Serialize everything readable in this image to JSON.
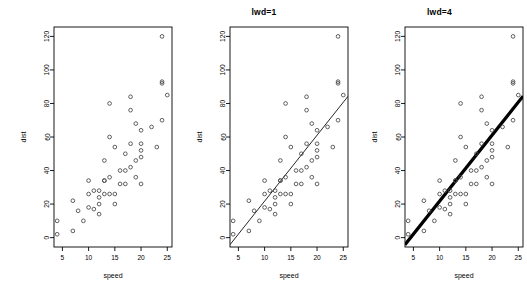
{
  "figure": {
    "background": "#ffffff",
    "foreground": "#000000",
    "point_symbol": "open-circle",
    "point_stroke": "#444444"
  },
  "panels": [
    {
      "name": "panel-plain",
      "title": "",
      "has_fit_line": false,
      "line_width": 0
    },
    {
      "name": "panel-lwd1",
      "title": "lwd=1",
      "has_fit_line": true,
      "line_width": 1
    },
    {
      "name": "panel-lwd4",
      "title": "lwd=4",
      "has_fit_line": true,
      "line_width": 4
    }
  ],
  "chart_data": {
    "type": "scatter",
    "title": "",
    "xlabel": "speed",
    "ylabel": "dist",
    "xlim": [
      3.4,
      25.9
    ],
    "ylim": [
      -5.6,
      125.6
    ],
    "xticks": [
      5,
      10,
      15,
      20,
      25
    ],
    "yticks": [
      0,
      20,
      40,
      60,
      80,
      100,
      120
    ],
    "xtick_labels": [
      "5",
      "10",
      "15",
      "20",
      "25"
    ],
    "ytick_labels": [
      "0",
      "20",
      "40",
      "60",
      "80",
      "100",
      "120"
    ],
    "grid": false,
    "legend": null,
    "x": [
      4,
      4,
      7,
      7,
      8,
      9,
      10,
      10,
      10,
      11,
      11,
      12,
      12,
      12,
      12,
      13,
      13,
      13,
      13,
      14,
      14,
      14,
      14,
      15,
      15,
      15,
      16,
      16,
      17,
      17,
      17,
      18,
      18,
      18,
      18,
      19,
      19,
      19,
      20,
      20,
      20,
      20,
      20,
      22,
      23,
      24,
      24,
      24,
      24,
      25
    ],
    "y": [
      2,
      10,
      4,
      22,
      16,
      10,
      18,
      26,
      34,
      17,
      28,
      14,
      20,
      24,
      28,
      26,
      34,
      34,
      46,
      26,
      36,
      60,
      80,
      20,
      26,
      54,
      32,
      40,
      32,
      40,
      50,
      42,
      56,
      76,
      84,
      36,
      46,
      68,
      32,
      48,
      52,
      56,
      64,
      66,
      54,
      70,
      92,
      93,
      120,
      85
    ],
    "series": [
      {
        "name": "cars",
        "x": [
          4,
          4,
          7,
          7,
          8,
          9,
          10,
          10,
          10,
          11,
          11,
          12,
          12,
          12,
          12,
          13,
          13,
          13,
          13,
          14,
          14,
          14,
          14,
          15,
          15,
          15,
          16,
          16,
          17,
          17,
          17,
          18,
          18,
          18,
          18,
          19,
          19,
          19,
          20,
          20,
          20,
          20,
          20,
          22,
          23,
          24,
          24,
          24,
          24,
          25
        ],
        "y": [
          2,
          10,
          4,
          22,
          16,
          10,
          18,
          26,
          34,
          17,
          28,
          14,
          20,
          24,
          28,
          26,
          34,
          34,
          46,
          26,
          36,
          60,
          80,
          20,
          26,
          54,
          32,
          40,
          32,
          40,
          50,
          42,
          56,
          76,
          84,
          36,
          46,
          68,
          32,
          48,
          52,
          56,
          64,
          66,
          54,
          70,
          92,
          93,
          120,
          85
        ]
      }
    ],
    "fit_line": {
      "type": "linear-regression",
      "intercept": -17.5791,
      "slope": 3.9324,
      "label": "lm(dist ~ speed)"
    }
  }
}
